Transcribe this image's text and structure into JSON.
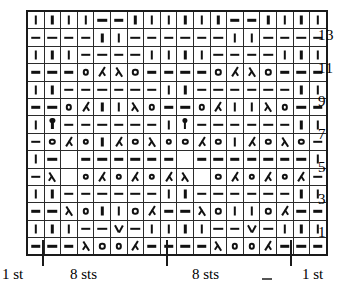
{
  "figure": {
    "kind": "knitting-stitch-chart",
    "title": "",
    "columns": 18,
    "rows": 14,
    "ink_color": "#111111",
    "background_color": "#ffffff"
  },
  "chart_data": {
    "type": "table",
    "title": "",
    "xlabel": "",
    "ylabel": "",
    "columns": 18,
    "rows": 14,
    "row_labels_visible": [
      "13",
      "11",
      "9",
      "7",
      "5",
      "3",
      "1"
    ],
    "symbol_legend": {
      "purl": "|",
      "knit": "-",
      "yo": "O",
      "dec-left": "λ",
      "dec-right": "ʎ",
      "vee": "V",
      "bobble": "bobble",
      "blank": ""
    },
    "grid": [
      {
        "row": 14,
        "label": "",
        "cells": [
          "purl",
          "purl",
          "purl",
          "purl",
          "knit",
          "knit",
          "purl",
          "purl",
          "purl",
          "purl",
          "purl",
          "purl",
          "knit",
          "knit",
          "purl",
          "purl",
          "purl",
          "purl"
        ]
      },
      {
        "row": 13,
        "label": "13",
        "cells": [
          "knit",
          "knit",
          "knit",
          "knit",
          "purl",
          "purl",
          "knit",
          "knit",
          "knit",
          "knit",
          "knit",
          "knit",
          "purl",
          "purl",
          "knit",
          "knit",
          "knit",
          "knit"
        ]
      },
      {
        "row": 12,
        "label": "",
        "cells": [
          "purl",
          "purl",
          "purl",
          "knit",
          "knit",
          "knit",
          "knit",
          "purl",
          "purl",
          "purl",
          "purl",
          "knit",
          "knit",
          "knit",
          "knit",
          "purl",
          "purl",
          "purl"
        ]
      },
      {
        "row": 11,
        "label": "11",
        "cells": [
          "knit",
          "knit",
          "knit",
          "yo",
          "dec-right",
          "dec-left",
          "yo",
          "knit",
          "knit",
          "knit",
          "knit",
          "yo",
          "dec-right",
          "dec-left",
          "yo",
          "knit",
          "knit",
          "knit"
        ]
      },
      {
        "row": 10,
        "label": "",
        "cells": [
          "purl",
          "purl",
          "knit",
          "knit",
          "knit",
          "knit",
          "knit",
          "knit",
          "purl",
          "purl",
          "knit",
          "knit",
          "knit",
          "knit",
          "knit",
          "knit",
          "purl",
          "purl"
        ]
      },
      {
        "row": 9,
        "label": "9",
        "cells": [
          "knit",
          "knit",
          "yo",
          "dec-right",
          "purl",
          "purl",
          "dec-left",
          "yo",
          "knit",
          "knit",
          "yo",
          "dec-right",
          "purl",
          "purl",
          "dec-left",
          "yo",
          "knit",
          "knit"
        ]
      },
      {
        "row": 8,
        "label": "",
        "cells": [
          "purl",
          "bobble",
          "knit",
          "knit",
          "knit",
          "knit",
          "knit",
          "knit",
          "purl",
          "bobble",
          "knit",
          "knit",
          "knit",
          "knit",
          "knit",
          "knit",
          "purl",
          "purl"
        ]
      },
      {
        "row": 7,
        "label": "7",
        "cells": [
          "knit",
          "yo",
          "dec-right",
          "yo",
          "purl",
          "dec-right",
          "yo",
          "dec-left",
          "yo",
          "yo",
          "dec-right",
          "yo",
          "purl",
          "dec-right",
          "yo",
          "dec-left",
          "yo",
          "knit"
        ]
      },
      {
        "row": 6,
        "label": "",
        "cells": [
          "purl",
          "knit",
          "blank",
          "knit",
          "knit",
          "knit",
          "knit",
          "knit",
          "knit",
          "blank",
          "knit",
          "knit",
          "knit",
          "knit",
          "knit",
          "knit",
          "knit",
          "purl"
        ]
      },
      {
        "row": 5,
        "label": "5",
        "cells": [
          "knit",
          "dec-left",
          "blank",
          "yo",
          "dec-right",
          "yo",
          "dec-right",
          "yo",
          "dec-right",
          "dec-left",
          "blank",
          "yo",
          "dec-right",
          "yo",
          "dec-right",
          "yo",
          "dec-right",
          "knit"
        ]
      },
      {
        "row": 4,
        "label": "",
        "cells": [
          "purl",
          "purl",
          "knit",
          "knit",
          "knit",
          "knit",
          "knit",
          "knit",
          "purl",
          "purl",
          "knit",
          "knit",
          "knit",
          "knit",
          "knit",
          "knit",
          "purl",
          "purl"
        ]
      },
      {
        "row": 3,
        "label": "3",
        "cells": [
          "knit",
          "knit",
          "dec-left",
          "yo",
          "purl",
          "purl",
          "yo",
          "dec-right",
          "knit",
          "knit",
          "dec-left",
          "yo",
          "purl",
          "purl",
          "yo",
          "dec-right",
          "knit",
          "knit"
        ]
      },
      {
        "row": 2,
        "label": "",
        "cells": [
          "purl",
          "purl",
          "purl",
          "knit",
          "knit",
          "vee",
          "knit",
          "purl",
          "purl",
          "purl",
          "purl",
          "knit",
          "knit",
          "vee",
          "knit",
          "purl",
          "purl",
          "purl"
        ]
      },
      {
        "row": 1,
        "label": "1",
        "cells": [
          "knit",
          "knit",
          "knit",
          "dec-left",
          "yo",
          "yo",
          "dec-right",
          "knit",
          "knit",
          "knit",
          "knit",
          "dec-left",
          "yo",
          "yo",
          "dec-right",
          "knit",
          "knit",
          "knit"
        ]
      }
    ]
  },
  "legend": {
    "labels": [
      {
        "id": "left-one-st",
        "text": "1 st"
      },
      {
        "id": "left-eight",
        "text": "8 sts"
      },
      {
        "id": "right-eight",
        "text": "8 sts"
      },
      {
        "id": "right-one-st",
        "text": "1 st"
      }
    ]
  }
}
